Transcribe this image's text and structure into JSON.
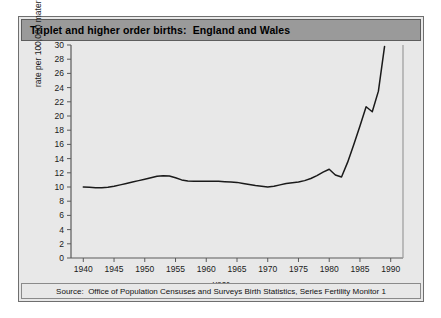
{
  "figure": {
    "title": "Triplet and higher order births:  England and Wales",
    "source": "Source:  Office of Population Censuses and Surveys Birth Statistics, Series Fertility Monitor 1",
    "frame_color": "#6f6f6f",
    "title_bar_color": "#9a9a9a",
    "background_color": "#e8e8e8",
    "line_color": "#1a1a1a"
  },
  "chart_data": {
    "type": "line",
    "title": "Triplet and higher order births:  England and Wales",
    "xlabel": "year",
    "ylabel": "rate per 100,000 maternities",
    "xlim": [
      1938,
      1992
    ],
    "ylim": [
      0,
      30
    ],
    "xticks": [
      1940,
      1945,
      1950,
      1955,
      1960,
      1965,
      1970,
      1975,
      1980,
      1985,
      1990
    ],
    "yticks": [
      0,
      2,
      4,
      6,
      8,
      10,
      12,
      14,
      16,
      18,
      20,
      22,
      24,
      26,
      28,
      30
    ],
    "grid": false,
    "legend": "none",
    "series": [
      {
        "name": "Triplet and higher order birth rate",
        "x": [
          1940,
          1941,
          1942,
          1943,
          1944,
          1945,
          1946,
          1947,
          1948,
          1949,
          1950,
          1951,
          1952,
          1953,
          1954,
          1955,
          1956,
          1957,
          1958,
          1959,
          1960,
          1961,
          1962,
          1963,
          1964,
          1965,
          1966,
          1967,
          1968,
          1969,
          1970,
          1971,
          1972,
          1973,
          1974,
          1975,
          1976,
          1977,
          1978,
          1979,
          1980,
          1981,
          1982,
          1983,
          1984,
          1985,
          1986,
          1987,
          1988,
          1989
        ],
        "values": [
          10.0,
          9.95,
          9.9,
          9.9,
          9.95,
          10.1,
          10.3,
          10.5,
          10.7,
          10.9,
          11.1,
          11.3,
          11.5,
          11.6,
          11.55,
          11.3,
          11.0,
          10.85,
          10.8,
          10.8,
          10.8,
          10.8,
          10.8,
          10.75,
          10.7,
          10.65,
          10.5,
          10.35,
          10.2,
          10.1,
          10.0,
          10.1,
          10.3,
          10.5,
          10.6,
          10.7,
          10.9,
          11.2,
          11.6,
          12.1,
          12.5,
          11.7,
          11.4,
          13.5,
          16.0,
          18.6,
          21.3,
          20.6,
          23.5,
          29.8
        ]
      }
    ]
  }
}
